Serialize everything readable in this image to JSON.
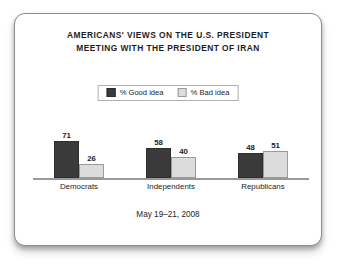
{
  "chart_data": {
    "type": "bar",
    "title": "AMERICANS' VIEWS ON THE U.S. PRESIDENT MEETING WITH THE PRESIDENT OF IRAN",
    "title_lines": [
      "AMERICANS' VIEWS ON THE U.S. PRESIDENT",
      "MEETING WITH THE PRESIDENT OF IRAN"
    ],
    "subtitle": "",
    "categories": [
      "Democrats",
      "Independents",
      "Republicans"
    ],
    "series": [
      {
        "name": "% Good idea",
        "values": [
          71,
          58,
          48
        ],
        "color": "#3a3a3a"
      },
      {
        "name": "% Bad idea",
        "values": [
          26,
          40,
          51
        ],
        "color": "#dcdcdc"
      }
    ],
    "xlabel": "",
    "ylabel": "",
    "ylim": [
      0,
      100
    ],
    "grid": false,
    "legend_position": "top-center",
    "annotations": [
      "May 19–21, 2008"
    ],
    "value_labels_shown": true
  },
  "legend": {
    "items": [
      {
        "label": "% Good idea",
        "swatch": "dark-swatch-icon"
      },
      {
        "label": "% Bad idea",
        "swatch": "light-swatch-icon"
      }
    ]
  },
  "footer": {
    "date_range": "May 19–21, 2008"
  },
  "colors": {
    "good_idea_bar": "#3a3a3a",
    "bad_idea_bar": "#dcdcdc",
    "bad_idea_border": "#9a9a9a",
    "frame_border": "#8c8c8c",
    "text": "#1d1d1d",
    "baseline": "#9a9a9a",
    "background": "#ffffff"
  }
}
